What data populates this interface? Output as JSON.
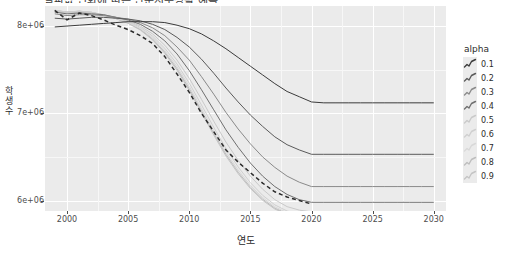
{
  "chart": {
    "title": "알파값 변화에 따른 단순지수평활 예측",
    "xlabel": "연도",
    "ylabel": "학생수"
  },
  "legend": {
    "title": "alpha",
    "items": [
      {
        "label": "0.1",
        "alpha": 0.1,
        "color": "#3b3b3b"
      },
      {
        "label": "0.2",
        "alpha": 0.2,
        "color": "#5a5a5a"
      },
      {
        "label": "0.3",
        "alpha": 0.3,
        "color": "#8a8a8a"
      },
      {
        "label": "0.4",
        "alpha": 0.4,
        "color": "#6f6f6f"
      },
      {
        "label": "0.5",
        "alpha": 0.5,
        "color": "#c9c9c9"
      },
      {
        "label": "0.6",
        "alpha": 0.6,
        "color": "#cfcfcf"
      },
      {
        "label": "0.7",
        "alpha": 0.7,
        "color": "#d8d8d8"
      },
      {
        "label": "0.8",
        "alpha": 0.8,
        "color": "#bdbdbd"
      },
      {
        "label": "0.9",
        "alpha": 0.9,
        "color": "#c4c4c4"
      }
    ]
  },
  "axes": {
    "x_ticks": [
      "2000",
      "2005",
      "2010",
      "2015",
      "2020",
      "2025",
      "2030"
    ],
    "x_tick_values": [
      2000,
      2005,
      2010,
      2015,
      2020,
      2025,
      2030
    ],
    "y_ticks": [
      "8e+06",
      "7e+06",
      "6e+06"
    ],
    "y_tick_values": [
      8000000,
      7000000,
      6000000
    ],
    "xlim": [
      1998.2,
      2031.0
    ],
    "ylim": [
      5880000,
      8230000
    ]
  },
  "chart_data": {
    "type": "line",
    "title": "알파값 변화에 따른 단순지수평활 예측",
    "xlabel": "연도",
    "ylabel": "학생수",
    "xlim": [
      1998.2,
      2031.0
    ],
    "ylim": [
      5880000,
      8230000
    ],
    "grid": true,
    "legend_position": "right",
    "legend_title": "alpha",
    "x": [
      1999,
      2000,
      2001,
      2002,
      2003,
      2004,
      2005,
      2006,
      2007,
      2008,
      2009,
      2010,
      2011,
      2012,
      2013,
      2014,
      2015,
      2016,
      2017,
      2018,
      2019,
      2020,
      2021,
      2022,
      2023,
      2024,
      2025,
      2026,
      2027,
      2028,
      2029,
      2030
    ],
    "forecast_start_year": 2021,
    "series": [
      {
        "name": "observed",
        "style": "dashed",
        "color": "#2b2b2b",
        "values": [
          8180000,
          8070000,
          8150000,
          8120000,
          8070000,
          8010000,
          7960000,
          7890000,
          7800000,
          7650000,
          7450000,
          7240000,
          7000000,
          6790000,
          6580000,
          6440000,
          6320000,
          6200000,
          6100000,
          6040000,
          6000000,
          5960000,
          null,
          null,
          null,
          null,
          null,
          null,
          null,
          null,
          null,
          null
        ]
      },
      {
        "name": "alpha=0.1",
        "color": "#3b3b3b",
        "values": [
          7990000,
          8000000,
          8010000,
          8020000,
          8030000,
          8040000,
          8050000,
          8050000,
          8050000,
          8040000,
          8010000,
          7970000,
          7910000,
          7830000,
          7740000,
          7640000,
          7540000,
          7440000,
          7340000,
          7250000,
          7190000,
          7130000,
          7120000,
          7120000,
          7120000,
          7120000,
          7120000,
          7120000,
          7120000,
          7120000,
          7120000,
          7120000
        ]
      },
      {
        "name": "alpha=0.2",
        "color": "#5a5a5a",
        "values": [
          8090000,
          8080000,
          8090000,
          8100000,
          8100000,
          8090000,
          8080000,
          8060000,
          8020000,
          7960000,
          7870000,
          7760000,
          7620000,
          7460000,
          7290000,
          7130000,
          6980000,
          6850000,
          6730000,
          6640000,
          6580000,
          6530000,
          6530000,
          6530000,
          6530000,
          6530000,
          6530000,
          6530000,
          6530000,
          6530000,
          6530000,
          6530000
        ]
      },
      {
        "name": "alpha=0.3",
        "color": "#8a8a8a",
        "values": [
          8140000,
          8120000,
          8130000,
          8130000,
          8120000,
          8100000,
          8080000,
          8040000,
          7980000,
          7890000,
          7760000,
          7610000,
          7420000,
          7220000,
          7010000,
          6820000,
          6650000,
          6500000,
          6380000,
          6280000,
          6210000,
          6160000,
          6160000,
          6160000,
          6160000,
          6160000,
          6160000,
          6160000,
          6160000,
          6160000,
          6160000,
          6160000
        ]
      },
      {
        "name": "alpha=0.4",
        "color": "#6f6f6f",
        "values": [
          8160000,
          8140000,
          8150000,
          8140000,
          8130000,
          8100000,
          8070000,
          8020000,
          7940000,
          7830000,
          7680000,
          7490000,
          7270000,
          7040000,
          6810000,
          6610000,
          6430000,
          6280000,
          6160000,
          6070000,
          6010000,
          5980000,
          5980000,
          5980000,
          5980000,
          5980000,
          5980000,
          5980000,
          5980000,
          5980000,
          5980000,
          5980000
        ]
      },
      {
        "name": "alpha=0.5",
        "color": "#c9c9c9",
        "values": [
          8170000,
          8150000,
          8160000,
          8150000,
          8130000,
          8100000,
          8060000,
          8000000,
          7910000,
          7780000,
          7610000,
          7400000,
          7160000,
          6910000,
          6670000,
          6460000,
          6280000,
          6130000,
          6010000,
          5930000,
          5890000,
          5870000,
          5870000,
          5870000,
          5870000,
          5870000,
          5870000,
          5870000,
          5870000,
          5870000,
          5870000,
          5870000
        ]
      },
      {
        "name": "alpha=0.6",
        "color": "#cfcfcf",
        "values": [
          8175000,
          8155000,
          8165000,
          8155000,
          8130000,
          8095000,
          8050000,
          7985000,
          7885000,
          7745000,
          7565000,
          7345000,
          7095000,
          6840000,
          6595000,
          6385000,
          6205000,
          6060000,
          5950000,
          5880000,
          5845000,
          5830000,
          5830000,
          5830000,
          5830000,
          5830000,
          5830000,
          5830000,
          5830000,
          5830000,
          5830000,
          5830000
        ]
      },
      {
        "name": "alpha=0.7",
        "color": "#d8d8d8",
        "values": [
          8178000,
          8158000,
          8168000,
          8156000,
          8128000,
          8090000,
          8042000,
          7972000,
          7866000,
          7720000,
          7534000,
          7309000,
          7056000,
          6800000,
          6556000,
          6349000,
          6174000,
          6034000,
          5928000,
          5862000,
          5830000,
          5818000,
          5818000,
          5818000,
          5818000,
          5818000,
          5818000,
          5818000,
          5818000,
          5818000,
          5818000,
          5818000
        ]
      },
      {
        "name": "alpha=0.8",
        "color": "#bdbdbd",
        "values": [
          8179000,
          8160000,
          8170000,
          8157000,
          8127000,
          8087000,
          8036000,
          7962000,
          7852000,
          7701000,
          7511000,
          7283000,
          7028000,
          6772000,
          6530000,
          6325000,
          6153000,
          6016000,
          5913000,
          5850000,
          5820000,
          5810000,
          5810000,
          5810000,
          5810000,
          5810000,
          5810000,
          5810000,
          5810000,
          5810000,
          5810000,
          5810000
        ]
      },
      {
        "name": "alpha=0.9",
        "color": "#c4c4c4",
        "values": [
          8180000,
          8161000,
          8171000,
          8158000,
          8126000,
          8085000,
          8031000,
          7954000,
          7841000,
          7687000,
          7493000,
          7263000,
          7007000,
          6751000,
          6511000,
          6308000,
          6138000,
          6003000,
          5902000,
          5842000,
          5814000,
          5805000,
          5805000,
          5805000,
          5805000,
          5805000,
          5805000,
          5805000,
          5805000,
          5805000,
          5805000,
          5805000
        ]
      }
    ]
  }
}
